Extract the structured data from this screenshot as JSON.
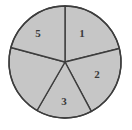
{
  "figure": {
    "name": "circle-divided-into-five-sectors",
    "background_color": "#ffffff"
  },
  "chart_data": {
    "type": "pie",
    "title": "",
    "xlabel": "",
    "ylabel": "",
    "legend": "none",
    "grid": false,
    "units": "degrees",
    "center": {
      "x": 65,
      "y": 62
    },
    "radius": 56,
    "fill_color": "#c6c6c6",
    "stroke_color": "#3d3d3d",
    "stroke_width": 1.4,
    "label_color": "#3a3a3a",
    "categories": [
      "1",
      "2",
      "3",
      "4",
      "5"
    ],
    "values": [
      76,
      76,
      58,
      45,
      105
    ],
    "slices": [
      {
        "label": "1",
        "start_angle": 14,
        "end_angle": 90,
        "sweep": 76,
        "label_visible": true,
        "label_x": 82,
        "label_y": 33
      },
      {
        "label": "2",
        "start_angle": -62,
        "end_angle": 14,
        "sweep": 76,
        "label_visible": true,
        "label_x": 97,
        "label_y": 74
      },
      {
        "label": "3",
        "start_angle": -120,
        "end_angle": -62,
        "sweep": 58,
        "label_visible": true,
        "label_x": 64,
        "label_y": 101
      },
      {
        "label": "4",
        "start_angle": -195,
        "end_angle": -120,
        "sweep": 75,
        "label_visible": false,
        "label_x": 29,
        "label_y": 86
      },
      {
        "label": "5",
        "start_angle": 90,
        "end_angle": 165,
        "sweep": 75,
        "label_visible": true,
        "label_x": 38,
        "label_y": 33
      }
    ]
  }
}
